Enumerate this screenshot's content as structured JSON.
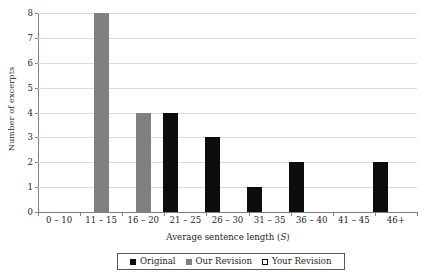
{
  "chart_data": {
    "type": "bar",
    "title": "",
    "subtitle": "",
    "xlabel_prefix": "Average sentence length (",
    "xlabel_symbol": "S",
    "xlabel_suffix": ")",
    "xlabel": "Average sentence length (S)",
    "ylabel": "Number of excerpts",
    "ylim": [
      0,
      8
    ],
    "ytick_labels": [
      "0",
      "1",
      "2",
      "3",
      "4",
      "5",
      "6",
      "7",
      "8"
    ],
    "ytick_values": [
      0,
      1,
      2,
      3,
      4,
      5,
      6,
      7,
      8
    ],
    "grid": "horizontal",
    "legend_position": "bottom-center",
    "categories": [
      "0 – 10",
      "11 – 15",
      "16 – 20",
      "21 – 25",
      "26 – 30",
      "31 – 35",
      "36 – 40",
      "41 – 45",
      "46+"
    ],
    "series": [
      {
        "name": "Original",
        "color": "#0d0d0d",
        "values": [
          0,
          0,
          0,
          4,
          3,
          1,
          2,
          0,
          2
        ]
      },
      {
        "name": "Our Revision",
        "color": "#808080",
        "values": [
          0,
          8,
          4,
          0,
          0,
          0,
          0,
          0,
          0
        ]
      },
      {
        "name": "Your Revision",
        "color": "#ffffff",
        "values": [
          0,
          0,
          0,
          0,
          0,
          0,
          0,
          0,
          0
        ]
      }
    ]
  },
  "legend": {
    "items": [
      {
        "label": "Original",
        "swatch": "filled-black-square"
      },
      {
        "label": "Our Revision",
        "swatch": "filled-gray-square"
      },
      {
        "label": "Your Revision",
        "swatch": "outlined-white-square"
      }
    ]
  },
  "colors": {
    "original": "#0d0d0d",
    "our_revision": "#808080",
    "your_revision": "#ffffff",
    "gridline": "#dcdcdc",
    "axis": "#808080",
    "text": "#231f20",
    "background": "#ffffff"
  }
}
